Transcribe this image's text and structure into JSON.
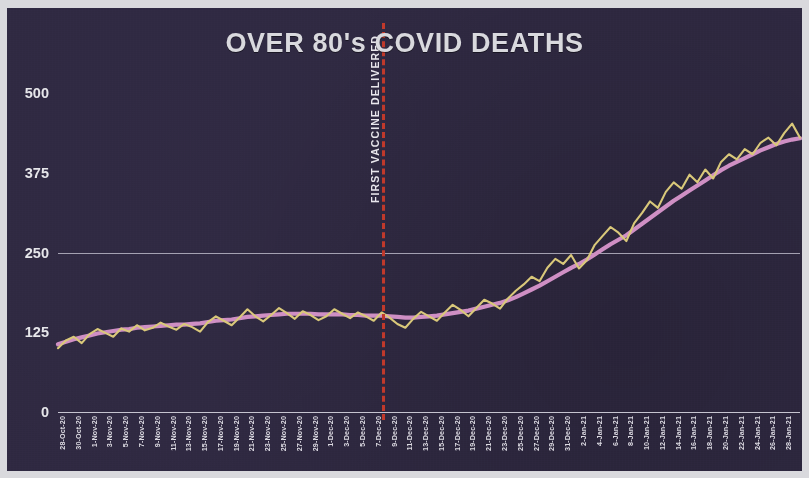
{
  "title": "OVER 80's COVID DEATHS",
  "colors": {
    "background": "#2e2840",
    "page_border": "#d9d9dd",
    "title": "#d9d9de",
    "gridline": "#b9b6c6",
    "daily_series": "#d9c87a",
    "trend_series": "#cf8fc4",
    "vaccine_line": "#c0392b",
    "tick_label": "#dcdae2"
  },
  "annotations": [
    {
      "name": "first-vaccine-delivered",
      "label": "FIRST VACCINE DELIVERED",
      "x_date": "8-Dec-20",
      "style": "dashed-vertical-line"
    }
  ],
  "chart_data": {
    "type": "line",
    "title": "OVER 80's COVID DEATHS",
    "xlabel": "",
    "ylabel": "",
    "ylim": [
      0,
      500
    ],
    "yticks": [
      0,
      125,
      250,
      375,
      500
    ],
    "ytick_labels": [
      "0",
      "125",
      "250",
      "375",
      "500"
    ],
    "grid": true,
    "legend": "none",
    "x": [
      "28-Oct-20",
      "29-Oct-20",
      "30-Oct-20",
      "31-Oct-20",
      "1-Nov-20",
      "2-Nov-20",
      "3-Nov-20",
      "4-Nov-20",
      "5-Nov-20",
      "6-Nov-20",
      "7-Nov-20",
      "8-Nov-20",
      "9-Nov-20",
      "10-Nov-20",
      "11-Nov-20",
      "12-Nov-20",
      "13-Nov-20",
      "14-Nov-20",
      "15-Nov-20",
      "16-Nov-20",
      "17-Nov-20",
      "18-Nov-20",
      "19-Nov-20",
      "20-Nov-20",
      "21-Nov-20",
      "22-Nov-20",
      "23-Nov-20",
      "24-Nov-20",
      "25-Nov-20",
      "26-Nov-20",
      "27-Nov-20",
      "28-Nov-20",
      "29-Nov-20",
      "30-Nov-20",
      "1-Dec-20",
      "2-Dec-20",
      "3-Dec-20",
      "4-Dec-20",
      "5-Dec-20",
      "6-Dec-20",
      "7-Dec-20",
      "8-Dec-20",
      "9-Dec-20",
      "10-Dec-20",
      "11-Dec-20",
      "12-Dec-20",
      "13-Dec-20",
      "14-Dec-20",
      "15-Dec-20",
      "16-Dec-20",
      "17-Dec-20",
      "18-Dec-20",
      "19-Dec-20",
      "20-Dec-20",
      "21-Dec-20",
      "22-Dec-20",
      "23-Dec-20",
      "24-Dec-20",
      "25-Dec-20",
      "26-Dec-20",
      "27-Dec-20",
      "28-Dec-20",
      "29-Dec-20",
      "30-Dec-20",
      "31-Dec-20",
      "1-Jan-21",
      "2-Jan-21",
      "3-Jan-21",
      "4-Jan-21",
      "5-Jan-21",
      "6-Jan-21",
      "7-Jan-21",
      "8-Jan-21",
      "9-Jan-21",
      "10-Jan-21",
      "11-Jan-21",
      "12-Jan-21",
      "13-Jan-21",
      "14-Jan-21",
      "15-Jan-21",
      "16-Jan-21",
      "17-Jan-21",
      "18-Jan-21",
      "19-Jan-21",
      "20-Jan-21",
      "21-Jan-21",
      "22-Jan-21",
      "23-Jan-21",
      "24-Jan-21",
      "25-Jan-21",
      "26-Jan-21",
      "27-Jan-21",
      "28-Jan-21",
      "29-Jan-21",
      "30-Jan-21"
    ],
    "xtick_labels": [
      "28-Oct-20",
      "30-Oct-20",
      "1-Nov-20",
      "3-Nov-20",
      "5-Nov-20",
      "7-Nov-20",
      "9-Nov-20",
      "11-Nov-20",
      "13-Nov-20",
      "15-Nov-20",
      "17-Nov-20",
      "19-Nov-20",
      "21-Nov-20",
      "23-Nov-20",
      "25-Nov-20",
      "27-Nov-20",
      "29-Nov-20",
      "1-Dec-20",
      "3-Dec-20",
      "5-Dec-20",
      "7-Dec-20",
      "9-Dec-20",
      "11-Dec-20",
      "13-Dec-20",
      "15-Dec-20",
      "17-Dec-20",
      "19-Dec-20",
      "21-Dec-20",
      "23-Dec-20",
      "25-Dec-20",
      "27-Dec-20",
      "29-Dec-20",
      "31-Dec-20",
      "2-Jan-21",
      "4-Jan-21",
      "6-Jan-21",
      "8-Jan-21",
      "10-Jan-21",
      "12-Jan-21",
      "14-Jan-21",
      "16-Jan-21",
      "18-Jan-21",
      "20-Jan-21",
      "22-Jan-21",
      "24-Jan-21",
      "26-Jan-21",
      "28-Jan-21",
      "30-Jan-21"
    ],
    "series": [
      {
        "name": "Daily deaths (over 80s)",
        "color": "#d9c87a",
        "style": "jagged",
        "values": [
          100,
          112,
          118,
          108,
          122,
          130,
          124,
          118,
          131,
          126,
          136,
          128,
          132,
          140,
          134,
          129,
          138,
          133,
          126,
          141,
          150,
          143,
          136,
          148,
          161,
          150,
          142,
          152,
          163,
          155,
          146,
          158,
          152,
          144,
          150,
          161,
          154,
          147,
          156,
          150,
          143,
          156,
          148,
          138,
          132,
          146,
          157,
          150,
          143,
          156,
          168,
          160,
          150,
          163,
          176,
          170,
          162,
          178,
          190,
          200,
          212,
          205,
          226,
          240,
          232,
          246,
          225,
          238,
          262,
          276,
          290,
          281,
          268,
          296,
          312,
          330,
          320,
          345,
          360,
          350,
          372,
          360,
          380,
          366,
          392,
          404,
          396,
          412,
          404,
          422,
          430,
          418,
          437,
          452,
          430
        ]
      },
      {
        "name": "7-day rolling average",
        "color": "#cf8fc4",
        "style": "smooth",
        "values": [
          106,
          110,
          114,
          117,
          120,
          123,
          125,
          127,
          129,
          130,
          132,
          133,
          134,
          135,
          136,
          137,
          137,
          138,
          139,
          141,
          143,
          144,
          145,
          147,
          149,
          150,
          151,
          152,
          153,
          154,
          154,
          154,
          154,
          153,
          153,
          153,
          153,
          152,
          152,
          151,
          151,
          151,
          150,
          149,
          148,
          148,
          149,
          150,
          151,
          153,
          155,
          157,
          159,
          162,
          165,
          168,
          171,
          175,
          180,
          186,
          192,
          198,
          205,
          212,
          219,
          226,
          232,
          239,
          247,
          255,
          263,
          270,
          277,
          286,
          295,
          304,
          313,
          322,
          331,
          339,
          347,
          355,
          363,
          371,
          379,
          386,
          392,
          398,
          404,
          410,
          415,
          420,
          424,
          427,
          429
        ]
      }
    ]
  }
}
